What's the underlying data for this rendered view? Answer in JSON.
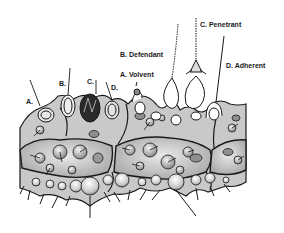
{
  "figure": {
    "labels": {
      "left_series": [
        {
          "id": "A",
          "text": "A."
        },
        {
          "id": "B",
          "text": "B."
        },
        {
          "id": "C",
          "text": "C."
        },
        {
          "id": "D",
          "text": "D."
        }
      ],
      "discharged": [
        {
          "id": "A",
          "text": "A. Volvent"
        },
        {
          "id": "B",
          "text": "B. Defendant"
        },
        {
          "id": "C",
          "text": "C. Penetrant"
        },
        {
          "id": "D",
          "text": "D. Adherent"
        }
      ]
    },
    "colors": {
      "ink": "#1a1a1a",
      "cell_fill": "#d6d6d6",
      "background": "#ffffff"
    }
  }
}
